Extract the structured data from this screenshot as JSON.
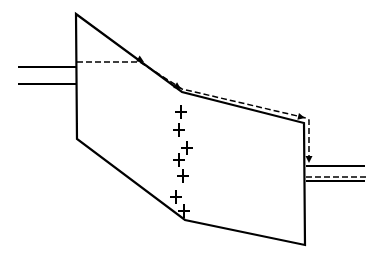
{
  "diagram": {
    "title": "",
    "stroke_color": "#000000",
    "background": "#ffffff",
    "vessel": {
      "points": [
        [
          76,
          14
        ],
        [
          182,
          92
        ],
        [
          304,
          123
        ],
        [
          305,
          245
        ],
        [
          185,
          220
        ],
        [
          77,
          139
        ]
      ]
    },
    "inlet_pipe": {
      "top": {
        "x1": 18,
        "y1": 67,
        "x2": 76,
        "y2": 67
      },
      "bottom": {
        "x1": 18,
        "y1": 84,
        "x2": 77,
        "y2": 84
      }
    },
    "outlet_pipe": {
      "top": {
        "x1": 306,
        "y1": 166,
        "x2": 365,
        "y2": 166
      },
      "bottom": {
        "x1": 306,
        "y1": 181,
        "x2": 365,
        "y2": 181
      },
      "dashed": {
        "x1": 306,
        "y1": 177,
        "x2": 368,
        "y2": 177
      }
    },
    "flow_path": {
      "points": [
        [
          77,
          62
        ],
        [
          140,
          62
        ],
        [
          182,
          89
        ],
        [
          306,
          118
        ],
        [
          309,
          120
        ],
        [
          309,
          163
        ]
      ],
      "arrowheads": [
        {
          "x": 144,
          "y": 62,
          "angle": 30
        },
        {
          "x": 181,
          "y": 89,
          "angle": 33
        },
        {
          "x": 305,
          "y": 118,
          "angle": 13
        },
        {
          "x": 309,
          "y": 163,
          "angle": 90
        }
      ]
    },
    "charges": {
      "symbol": "+",
      "positions": [
        [
          181,
          112
        ],
        [
          179,
          130
        ],
        [
          187,
          148
        ],
        [
          179,
          160
        ],
        [
          183,
          176
        ],
        [
          176,
          197
        ],
        [
          184,
          211
        ]
      ]
    }
  }
}
